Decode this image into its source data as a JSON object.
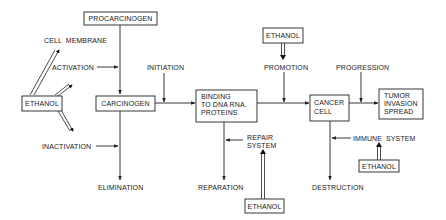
{
  "diagram": {
    "type": "flow",
    "title": "",
    "nodes": {
      "procarcinogen": "PROCARCINOGEN",
      "carcinogen": "CARCINOGEN",
      "binding": [
        "BINDING",
        "TO DNA RNA.",
        "PROTEINS"
      ],
      "cancer_cell": [
        "CANCER",
        "CELL"
      ],
      "tumor": [
        "TUMOR",
        "INVASION",
        "SPREAD"
      ],
      "ethanol_left": "ETHANOL",
      "ethanol_top": "ETHANOL",
      "ethanol_repair": "ETHANOL",
      "ethanol_immune": "ETHANOL"
    },
    "labels": {
      "cell_membrane": "CELL  MEMBRANE",
      "activation": "ACTIVATION",
      "inactivation": "INACTIVATION",
      "elimination": "ELIMINATION",
      "initiation": "INITIATION",
      "promotion": "PROMOTION",
      "progression": "PROGRESSION",
      "repair_system": [
        "REPAIR",
        "SYSTEM"
      ],
      "reparation": "REPARATION",
      "immune_system": "IMMUNE  SYSTEM",
      "destruction": "DESTRUCTION"
    },
    "edges": [
      {
        "from": "PROCARCINOGEN",
        "to": "CARCINOGEN",
        "modifier": "ACTIVATION"
      },
      {
        "from": "CARCINOGEN",
        "to": "ELIMINATION",
        "modifier": "INACTIVATION"
      },
      {
        "from": "CARCINOGEN",
        "to": "BINDING TO DNA RNA. PROTEINS",
        "modifier": "INITIATION"
      },
      {
        "from": "BINDING TO DNA RNA. PROTEINS",
        "to": "CANCER CELL",
        "modifier": "PROMOTION"
      },
      {
        "from": "BINDING TO DNA RNA. PROTEINS",
        "to": "REPARATION",
        "modifier": "REPAIR SYSTEM"
      },
      {
        "from": "CANCER CELL",
        "to": "TUMOR INVASION SPREAD",
        "modifier": "PROGRESSION"
      },
      {
        "from": "CANCER CELL",
        "to": "DESTRUCTION",
        "modifier": "IMMUNE SYSTEM"
      },
      {
        "from": "ETHANOL",
        "to": "CELL MEMBRANE",
        "style": "double"
      },
      {
        "from": "ETHANOL",
        "to": "ACTIVATION",
        "style": "double"
      },
      {
        "from": "ETHANOL",
        "to": "INACTIVATION",
        "style": "double"
      },
      {
        "from": "ETHANOL",
        "to": "PROMOTION",
        "style": "double"
      },
      {
        "from": "ETHANOL",
        "to": "REPAIR SYSTEM",
        "style": "double"
      },
      {
        "from": "ETHANOL",
        "to": "IMMUNE SYSTEM",
        "style": "double"
      }
    ]
  }
}
